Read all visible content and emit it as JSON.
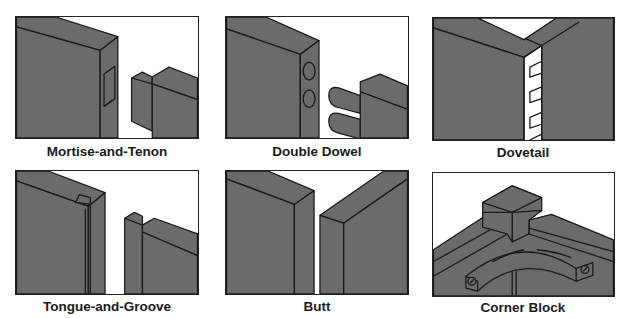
{
  "figure": {
    "colors": {
      "wood_fill": "#6b6b6b",
      "outline": "#1a1a1a",
      "background": "#ffffff"
    },
    "panels": [
      {
        "id": "mortise-and-tenon",
        "label": "Mortise-and-Tenon"
      },
      {
        "id": "double-dowel",
        "label": "Double Dowel"
      },
      {
        "id": "dovetail",
        "label": "Dovetail"
      },
      {
        "id": "tongue-and-groove",
        "label": "Tongue-and-Groove"
      },
      {
        "id": "butt",
        "label": "Butt"
      },
      {
        "id": "corner-block",
        "label": "Corner Block"
      }
    ]
  }
}
